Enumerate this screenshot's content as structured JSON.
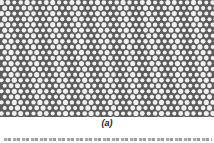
{
  "figure": {
    "type": "micrograph",
    "lattice": {
      "background_color": "#5c5c5c",
      "hole_color": "#f2f2f2",
      "pitch_x": 6.4,
      "pitch_y": 5.55,
      "hole_radius": 2.3
    },
    "label": "(a)"
  },
  "caption": {
    "text_legible": false
  }
}
